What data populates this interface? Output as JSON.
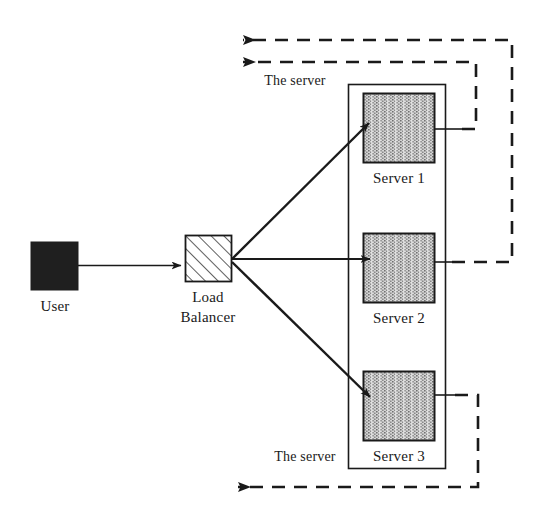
{
  "diagram": {
    "colors": {
      "stroke": "#1a1a1a",
      "user_fill": "#1f1f1f",
      "server_fill_base": "#c8c8c8",
      "server_stripe": "#6e6e6e",
      "hatch_stroke": "#1a1a1a",
      "background": "#ffffff"
    },
    "nodes": [
      {
        "id": "user",
        "label": "User",
        "shape": "filled-square",
        "x": 31,
        "y": 242,
        "w": 47,
        "h": 48,
        "label_x": 55,
        "label_y": 311
      },
      {
        "id": "load-balancer",
        "label_line1": "Load",
        "label_line2": "Balancer",
        "shape": "hatched-square",
        "x": 185,
        "y": 235,
        "w": 46,
        "h": 46,
        "label_x": 208,
        "label_y": 302
      },
      {
        "id": "server-1",
        "label": "Server 1",
        "shape": "stippled-rect",
        "x": 363,
        "y": 93,
        "w": 72,
        "h": 70,
        "label_x": 399,
        "label_y": 183
      },
      {
        "id": "server-2",
        "label": "Server 2",
        "shape": "stippled-rect",
        "x": 363,
        "y": 233,
        "w": 72,
        "h": 70,
        "label_x": 399,
        "label_y": 323
      },
      {
        "id": "server-3",
        "label": "Server 3",
        "shape": "stippled-rect",
        "x": 363,
        "y": 371,
        "w": 72,
        "h": 70,
        "label_x": 399,
        "label_y": 461
      }
    ],
    "server_group": {
      "id": "server-pool",
      "x": 348,
      "y": 84,
      "w": 97,
      "h": 384
    },
    "flow_labels": [
      {
        "id": "top-return-label",
        "text": "The server",
        "x": 295,
        "y": 85
      },
      {
        "id": "bottom-return-label",
        "text": "The server",
        "x": 305,
        "y": 461
      }
    ],
    "request_edges": [
      {
        "id": "user-to-lb",
        "from": "user",
        "to": "load-balancer",
        "style": "solid"
      },
      {
        "id": "lb-to-server-1",
        "from": "load-balancer",
        "to": "server-1",
        "style": "solid"
      },
      {
        "id": "lb-to-server-2",
        "from": "load-balancer",
        "to": "server-2",
        "style": "solid"
      },
      {
        "id": "lb-to-server-3",
        "from": "load-balancer",
        "to": "server-3",
        "style": "solid"
      }
    ],
    "response_edges": [
      {
        "id": "server-1-return",
        "from": "server-1",
        "style": "dashed",
        "direction": "left"
      },
      {
        "id": "server-2-return",
        "from": "server-2",
        "style": "dashed",
        "direction": "left"
      },
      {
        "id": "server-3-return",
        "from": "server-3",
        "style": "dashed",
        "direction": "left"
      }
    ]
  }
}
